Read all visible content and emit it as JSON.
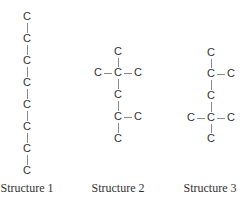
{
  "figure": {
    "structures": [
      {
        "label": "Structure 1",
        "label_pos": [
          27,
          181
        ],
        "atoms": [
          {
            "symbol": "C",
            "x": 27,
            "y": 17
          },
          {
            "symbol": "C",
            "x": 27,
            "y": 39
          },
          {
            "symbol": "C",
            "x": 27,
            "y": 61
          },
          {
            "symbol": "C",
            "x": 27,
            "y": 83
          },
          {
            "symbol": "C",
            "x": 27,
            "y": 105
          },
          {
            "symbol": "C",
            "x": 27,
            "y": 127
          },
          {
            "symbol": "C",
            "x": 27,
            "y": 149
          },
          {
            "symbol": "C",
            "x": 27,
            "y": 171
          }
        ],
        "bonds": [
          [
            0,
            1
          ],
          [
            1,
            2
          ],
          [
            2,
            3
          ],
          [
            3,
            4
          ],
          [
            4,
            5
          ],
          [
            5,
            6
          ],
          [
            6,
            7
          ]
        ]
      },
      {
        "label": "Structure 2",
        "label_pos": [
          118,
          181
        ],
        "atoms": [
          {
            "symbol": "C",
            "x": 118,
            "y": 52
          },
          {
            "symbol": "C",
            "x": 98,
            "y": 73
          },
          {
            "symbol": "C",
            "x": 118,
            "y": 73
          },
          {
            "symbol": "C",
            "x": 138,
            "y": 73
          },
          {
            "symbol": "C",
            "x": 118,
            "y": 95
          },
          {
            "symbol": "C",
            "x": 118,
            "y": 117
          },
          {
            "symbol": "C",
            "x": 138,
            "y": 117
          },
          {
            "symbol": "C",
            "x": 118,
            "y": 139
          }
        ],
        "bonds": [
          [
            0,
            2
          ],
          [
            1,
            2
          ],
          [
            2,
            3
          ],
          [
            2,
            4
          ],
          [
            4,
            5
          ],
          [
            5,
            6
          ],
          [
            5,
            7
          ]
        ]
      },
      {
        "label": "Structure 3",
        "label_pos": [
          210,
          181
        ],
        "atoms": [
          {
            "symbol": "C",
            "x": 211,
            "y": 53
          },
          {
            "symbol": "C",
            "x": 211,
            "y": 74
          },
          {
            "symbol": "C",
            "x": 231,
            "y": 74
          },
          {
            "symbol": "C",
            "x": 211,
            "y": 96
          },
          {
            "symbol": "C",
            "x": 191,
            "y": 118
          },
          {
            "symbol": "C",
            "x": 211,
            "y": 118
          },
          {
            "symbol": "C",
            "x": 231,
            "y": 118
          },
          {
            "symbol": "C",
            "x": 211,
            "y": 139
          }
        ],
        "bonds": [
          [
            0,
            1
          ],
          [
            1,
            2
          ],
          [
            1,
            3
          ],
          [
            3,
            5
          ],
          [
            4,
            5
          ],
          [
            5,
            6
          ],
          [
            5,
            7
          ]
        ]
      }
    ]
  }
}
